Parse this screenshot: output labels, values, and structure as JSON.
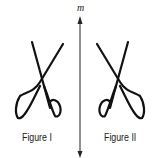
{
  "diagram": {
    "axis_label": "m",
    "figures": [
      {
        "label": "Figure I",
        "description": "scissors"
      },
      {
        "label": "Figure II",
        "description": "scissors reflected across line m"
      }
    ],
    "stroke_color": "#111111"
  }
}
